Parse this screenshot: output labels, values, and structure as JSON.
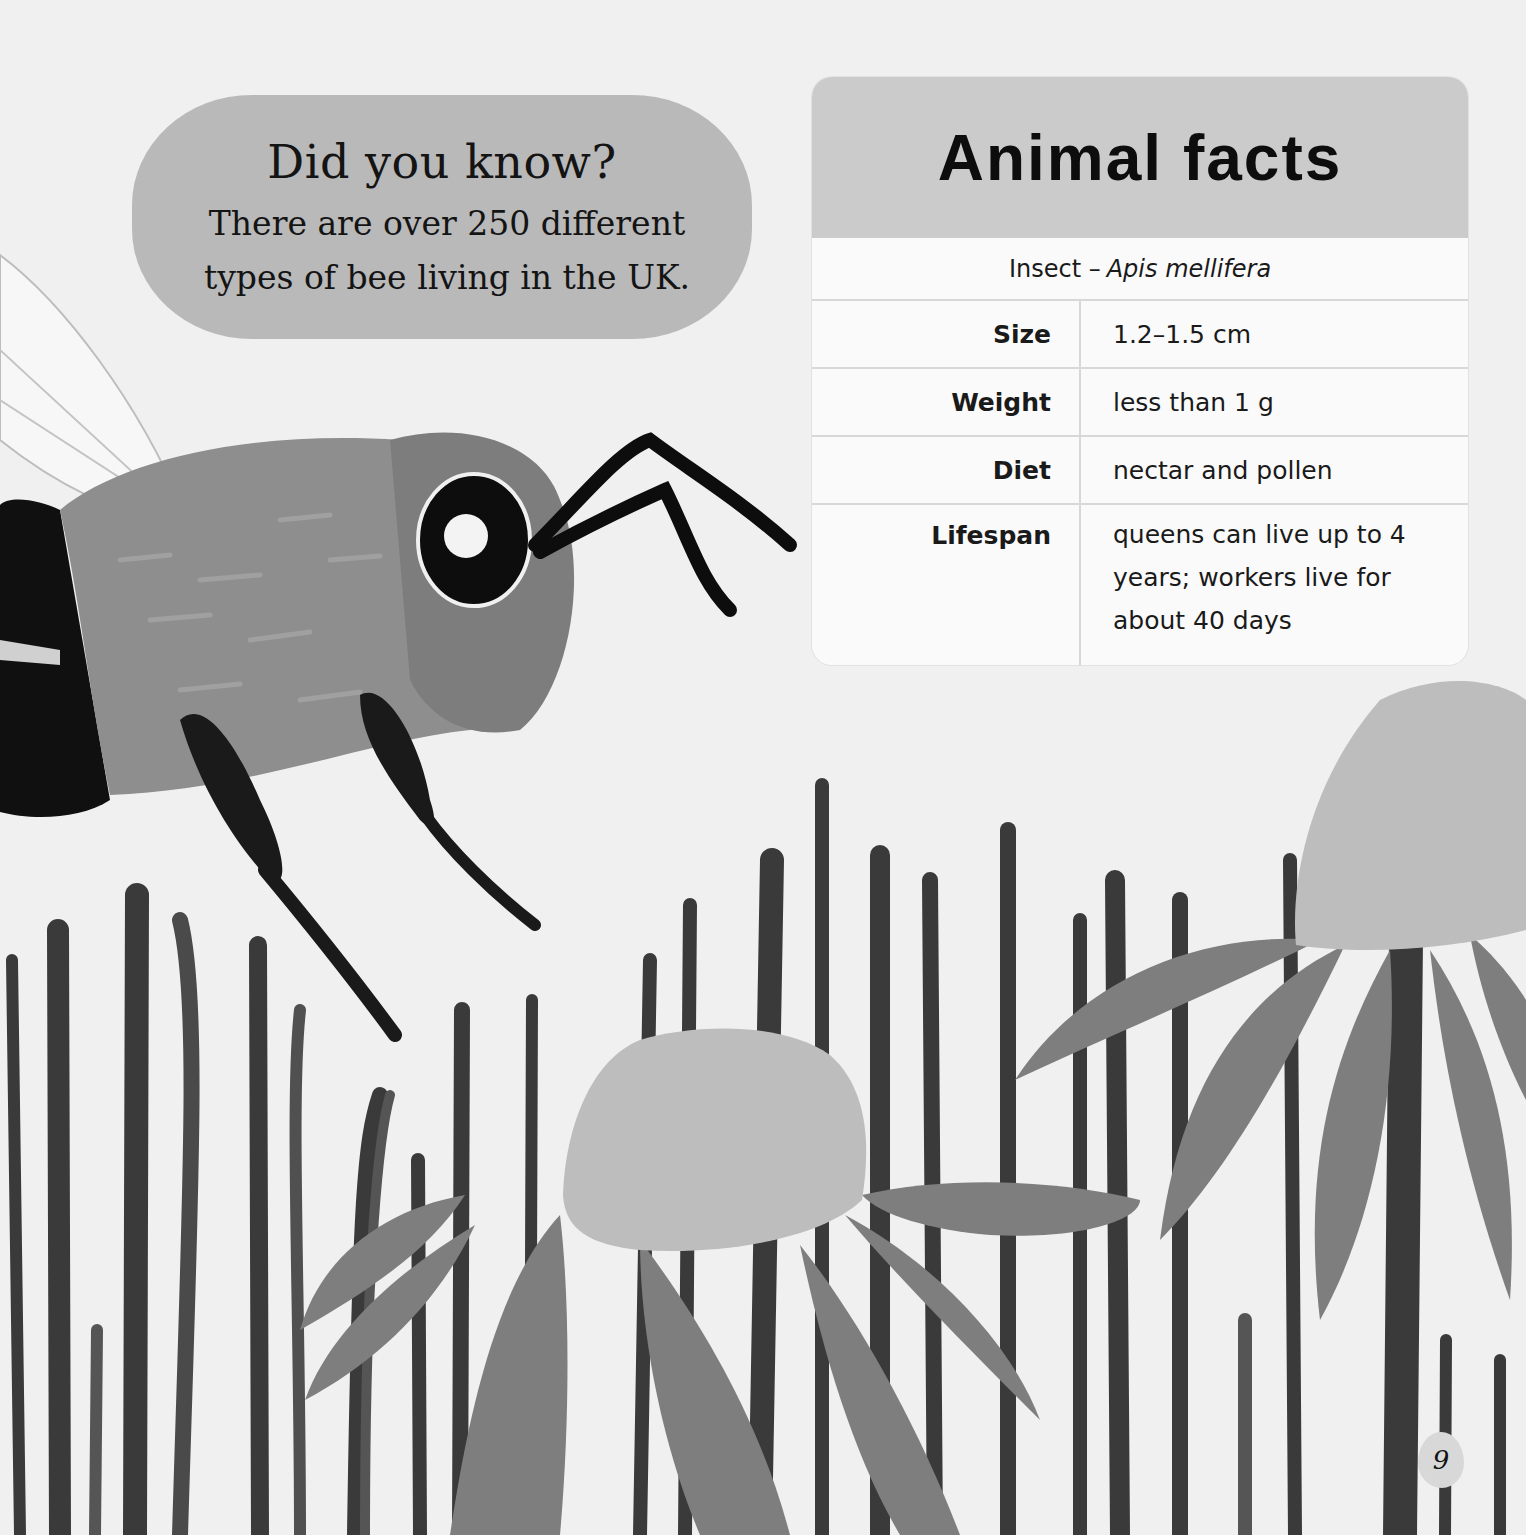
{
  "did_you_know": {
    "heading": "Did you know?",
    "text": "There are over 250 different types of bee living in the UK."
  },
  "animal_facts": {
    "title": "Animal facts",
    "category": "Insect –",
    "species": "Apis mellifera",
    "rows": [
      {
        "label": "Size",
        "value": "1.2–1.5 cm"
      },
      {
        "label": "Weight",
        "value": "less than 1 g"
      },
      {
        "label": "Diet",
        "value": "nectar and pollen"
      },
      {
        "label": "Lifespan",
        "value": "queens can live up to 4 years; workers live for about 40 days"
      }
    ]
  },
  "page_number": "9",
  "illustration": {
    "subjects": [
      "bee-icon",
      "grass-icon",
      "coneflower-icon",
      "coneflower-icon"
    ],
    "colors": {
      "background": "#f0f0f0",
      "grass": "#3a3a3a",
      "petal": "#7e7e7e",
      "flower_center": "#bdbdbd",
      "bee_body": "#8a8a8a"
    }
  }
}
